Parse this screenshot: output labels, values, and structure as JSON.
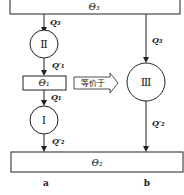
{
  "diagram": {
    "top_reservoir": {
      "label": "Θ₃"
    },
    "middle_reservoir": {
      "label": "Θ₁"
    },
    "bottom_reservoir": {
      "label": "Θ₂"
    },
    "engines": [
      {
        "id": "II",
        "label": "Ⅱ"
      },
      {
        "id": "I",
        "label": "Ⅰ"
      },
      {
        "id": "III",
        "label": "Ⅲ"
      }
    ],
    "flows": {
      "q3_left": "Q₃",
      "q1p_left": "Q′₁",
      "q1_left": "Q₁",
      "q2p_left": "Q′₂",
      "q3_right": "Q₃",
      "q2p_right": "Q′₂"
    },
    "equiv_arrow": {
      "label": "等价于"
    },
    "bottom_labels": {
      "a": "a",
      "b": "b"
    }
  }
}
